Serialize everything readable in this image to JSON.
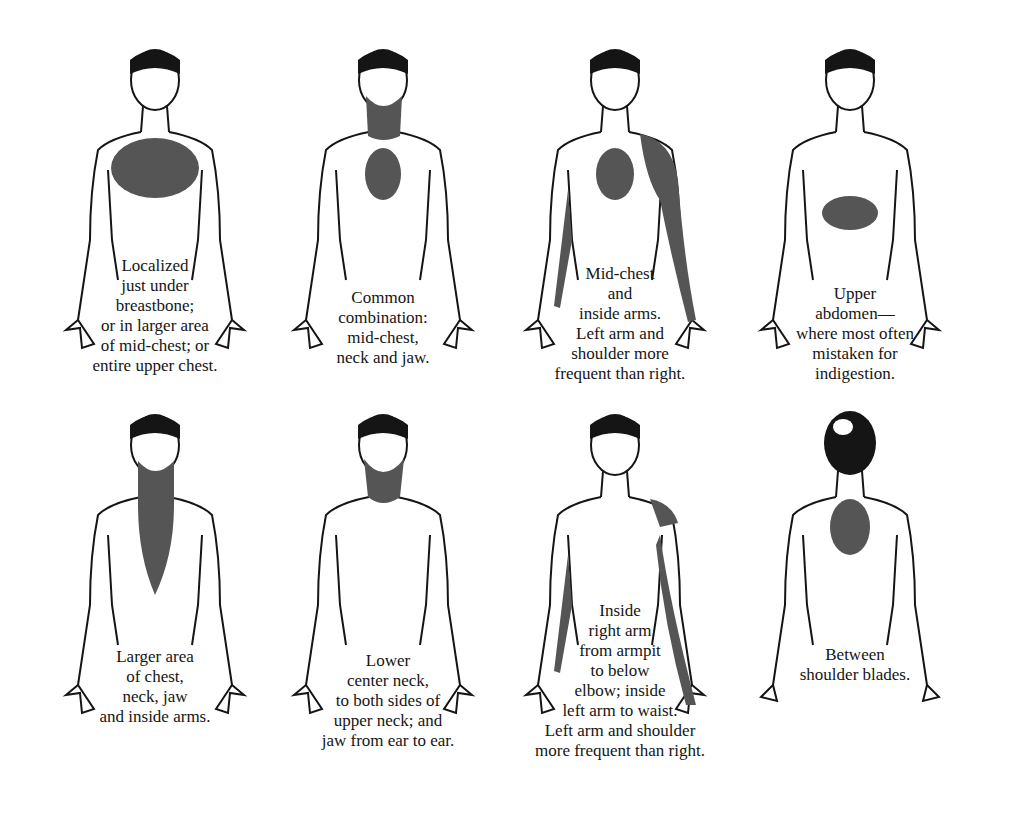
{
  "figure": {
    "colors": {
      "ink": "#151515",
      "shade": "#555555",
      "paper": "#ffffff"
    },
    "panels": [
      {
        "id": "p1",
        "view": "front",
        "shaded": [
          "upper-chest-large"
        ],
        "caption": "Localized\njust under\nbreastbone;\nor in larger area\nof mid-chest; or\nentire upper chest."
      },
      {
        "id": "p2",
        "view": "front",
        "shaded": [
          "mid-chest",
          "neck",
          "jaw"
        ],
        "caption": "Common\ncombination:\nmid-chest,\nneck and jaw."
      },
      {
        "id": "p3",
        "view": "front",
        "shaded": [
          "mid-chest",
          "left-shoulder",
          "inside-arms"
        ],
        "caption": "Mid-chest\nand\ninside arms.\nLeft arm and\nshoulder more\nfrequent than right."
      },
      {
        "id": "p4",
        "view": "front",
        "shaded": [
          "upper-abdomen"
        ],
        "caption": "Upper\nabdomen—\nwhere most often\nmistaken for\nindigestion."
      },
      {
        "id": "p5",
        "view": "front",
        "shaded": [
          "neck",
          "jaw",
          "chest-central"
        ],
        "caption": "Larger area\nof chest,\nneck, jaw\nand inside arms."
      },
      {
        "id": "p6",
        "view": "front",
        "shaded": [
          "lower-neck",
          "jaw"
        ],
        "caption": "Lower\ncenter neck,\nto both sides of\nupper neck; and\njaw from ear to ear."
      },
      {
        "id": "p7",
        "view": "front",
        "shaded": [
          "left-shoulder",
          "inside-arms"
        ],
        "caption": "Inside\nright arm\nfrom armpit\nto below\nelbow; inside\nleft arm to waist.\nLeft arm and shoulder\nmore frequent than right."
      },
      {
        "id": "p8",
        "view": "back",
        "shaded": [
          "between-shoulder-blades"
        ],
        "caption": "Between\nshoulder blades."
      }
    ]
  }
}
